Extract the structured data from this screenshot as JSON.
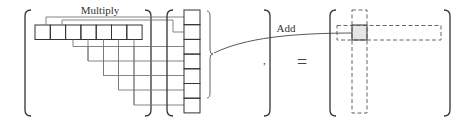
{
  "diagram": {
    "type": "matrix-vector-multiplication-illustration",
    "labels": {
      "multiply": "Multiply",
      "add": "Add",
      "comma": ",",
      "equals": "="
    },
    "left_matrix": {
      "row_cells": 7,
      "description": "highlighted row of 7 cells inside a bracketed matrix"
    },
    "vector": {
      "cells": 7,
      "description": "column vector of 7 cells with a brace on its right"
    },
    "result_matrix": {
      "description": "bracketed result matrix with dashed row and dashed column intersecting at a shaded cell",
      "highlight_color": "#e6e6e6"
    },
    "colors": {
      "line": "#333333",
      "connector": "#666666",
      "dashed": "#555555",
      "shaded_cell": "#e6e6e6"
    }
  }
}
